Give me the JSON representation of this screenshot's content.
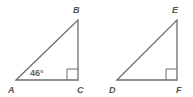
{
  "diagram": {
    "triangles": [
      {
        "name": "ABC",
        "vertices": {
          "A": [
            16,
            80
          ],
          "B": [
            78,
            20
          ],
          "C": [
            78,
            80
          ]
        },
        "labels": {
          "A": "A",
          "B": "B",
          "C": "C"
        },
        "right_angle_at": "C",
        "angle_label": "46°",
        "angle_at": "A"
      },
      {
        "name": "DEF",
        "vertices": {
          "D": [
            117,
            80
          ],
          "E": [
            177,
            20
          ],
          "F": [
            177,
            80
          ]
        },
        "labels": {
          "D": "D",
          "E": "E",
          "F": "F"
        },
        "right_angle_at": "F"
      }
    ],
    "colors": {
      "stroke": "#6e6e6e",
      "text": "#555555"
    }
  }
}
